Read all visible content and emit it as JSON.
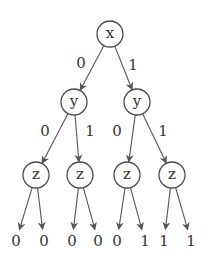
{
  "diagram": {
    "type": "binary-decision-tree",
    "nodes": [
      {
        "id": "n0",
        "label": "x",
        "cx": 110,
        "cy": 34
      },
      {
        "id": "n1",
        "label": "y",
        "cx": 74,
        "cy": 102
      },
      {
        "id": "n2",
        "label": "y",
        "cx": 137,
        "cy": 102
      },
      {
        "id": "n3",
        "label": "z",
        "cx": 36,
        "cy": 175
      },
      {
        "id": "n4",
        "label": "z",
        "cx": 80,
        "cy": 175
      },
      {
        "id": "n5",
        "label": "z",
        "cx": 127,
        "cy": 175
      },
      {
        "id": "n6",
        "label": "z",
        "cx": 172,
        "cy": 175
      }
    ],
    "edges": [
      {
        "from": "n0",
        "to": "n1",
        "label": "0",
        "lx": 81,
        "ly": 63
      },
      {
        "from": "n0",
        "to": "n2",
        "label": "1",
        "lx": 133,
        "ly": 65
      },
      {
        "from": "n1",
        "to": "n3",
        "label": "0",
        "lx": 45,
        "ly": 131
      },
      {
        "from": "n1",
        "to": "n4",
        "label": "1",
        "lx": 90,
        "ly": 131
      },
      {
        "from": "n2",
        "to": "n5",
        "label": "0",
        "lx": 117,
        "ly": 131
      },
      {
        "from": "n2",
        "to": "n6",
        "label": "1",
        "lx": 163,
        "ly": 131
      }
    ],
    "leaves": [
      {
        "from": "n3",
        "value": "0",
        "x": 16,
        "y": 241
      },
      {
        "from": "n3",
        "value": "0",
        "x": 44,
        "y": 241
      },
      {
        "from": "n4",
        "value": "0",
        "x": 72,
        "y": 241
      },
      {
        "from": "n4",
        "value": "0",
        "x": 98,
        "y": 241
      },
      {
        "from": "n5",
        "value": "0",
        "x": 117,
        "y": 241
      },
      {
        "from": "n5",
        "value": "1",
        "x": 145,
        "y": 241
      },
      {
        "from": "n6",
        "value": "1",
        "x": 164,
        "y": 241
      },
      {
        "from": "n6",
        "value": "1",
        "x": 191,
        "y": 241
      }
    ],
    "node_radius": 13,
    "colors": {
      "stroke": "#4a4a4a",
      "text": "#333333",
      "background": "#ffffff"
    }
  }
}
